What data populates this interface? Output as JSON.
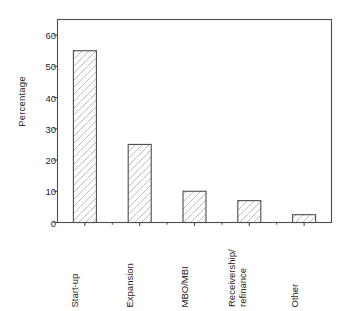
{
  "chart_data": {
    "type": "bar",
    "title": "",
    "subtitle": "",
    "xlabel": "",
    "ylabel": "Percentage",
    "categories": [
      "Start-up",
      "Expansion",
      "MBO/MBI",
      "Receivership/\nrefinance",
      "Other"
    ],
    "values": [
      55,
      25,
      10,
      7,
      2.5
    ],
    "ylim": [
      0,
      65
    ],
    "yticks": [
      0,
      10,
      20,
      30,
      40,
      50,
      60
    ],
    "ytick_labels": [
      "0",
      "10",
      "20",
      "30",
      "40",
      "50",
      "60"
    ],
    "grid": false,
    "legend": null,
    "legend_position": "none",
    "bar_style": {
      "fill": "#ffffff",
      "hatch": "/",
      "hatch_color": "#b8b8b8",
      "edge_color": "#4d4d4d"
    },
    "axis_color": "#4d4d4d",
    "frame": "full-box",
    "annotations": []
  },
  "axis": {
    "y_title": "Percentage"
  }
}
